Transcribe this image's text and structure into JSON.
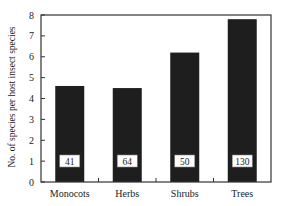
{
  "chart_data": {
    "type": "bar",
    "title": "",
    "xlabel": "",
    "ylabel": "No. of species per host insect species",
    "categories": [
      "Monocots",
      "Herbs",
      "Shrubs",
      "Trees"
    ],
    "values": [
      4.6,
      4.5,
      6.2,
      7.8
    ],
    "bar_labels": [
      "41",
      "64",
      "50",
      "130"
    ],
    "ylim": [
      0,
      8
    ],
    "yticks": [
      0,
      1,
      2,
      3,
      4,
      5,
      6,
      7,
      8
    ],
    "grid": false,
    "legend": null,
    "bar_color": "#1e1e1e",
    "label_box_color": "#ffffff"
  }
}
